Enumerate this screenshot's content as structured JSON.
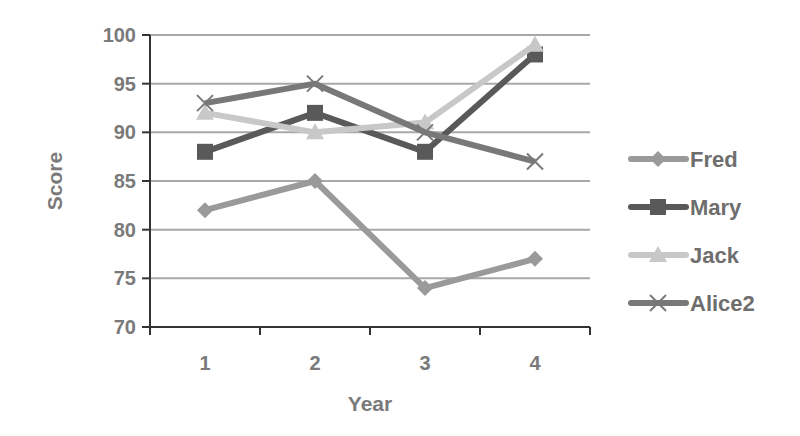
{
  "chart_data": {
    "type": "line",
    "title": "",
    "xlabel": "Year",
    "ylabel": "Score",
    "categories": [
      "1",
      "2",
      "3",
      "4"
    ],
    "x": [
      1,
      2,
      3,
      4
    ],
    "ylim": [
      70,
      100
    ],
    "yticks": [
      70,
      75,
      80,
      85,
      90,
      95,
      100
    ],
    "grid": true,
    "legend_position": "right",
    "series": [
      {
        "name": "Fred",
        "values": [
          82,
          85,
          74,
          77
        ],
        "color": "#9a9a9a",
        "marker": "diamond"
      },
      {
        "name": "Mary",
        "values": [
          88,
          92,
          88,
          98
        ],
        "color": "#595959",
        "marker": "square"
      },
      {
        "name": "Jack",
        "values": [
          92,
          90,
          91,
          99
        ],
        "color": "#c8c8c8",
        "marker": "triangle"
      },
      {
        "name": "Alice2",
        "values": [
          93,
          95,
          90,
          87
        ],
        "color": "#787878",
        "marker": "x"
      }
    ]
  }
}
